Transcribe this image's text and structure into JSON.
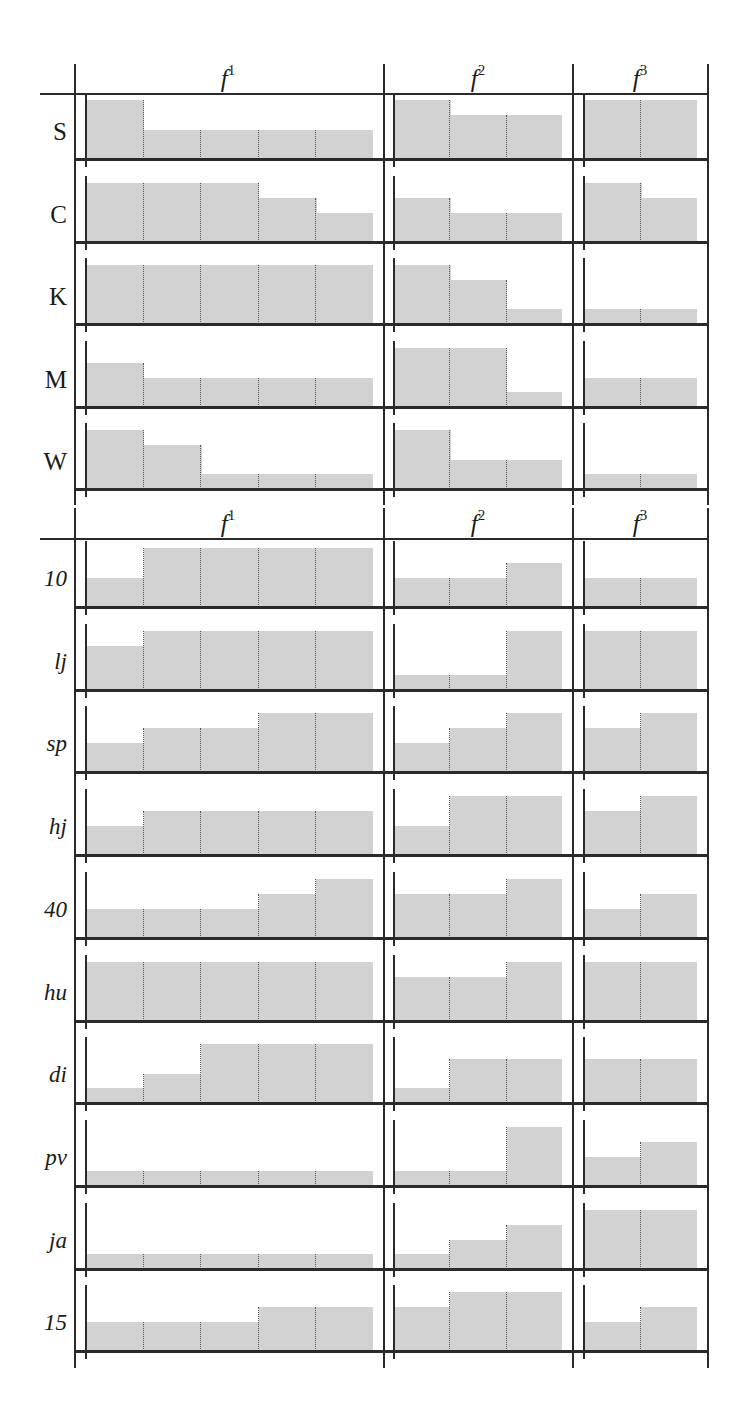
{
  "chart_data": {
    "type": "bar",
    "subtype": "small-multiple step histograms (quantized heights)",
    "title": "",
    "columns": [
      {
        "key": "f1",
        "label": "f",
        "superscript": "1",
        "bins": 5
      },
      {
        "key": "f2",
        "label": "f",
        "superscript": "2",
        "bins": 3
      },
      {
        "key": "f3",
        "label": "f",
        "superscript": "3",
        "bins": 2
      }
    ],
    "value_scale": "relative height, quarters of cell max (0.25, 0.5, 0.75, 1.0)",
    "grid": false,
    "legend": null,
    "sections": [
      {
        "label_style": "upright",
        "rows": [
          {
            "label": "S",
            "f1": [
              1,
              0.5,
              0.5,
              0.5,
              0.5
            ],
            "f2": [
              1,
              0.75,
              0.75
            ],
            "f3": [
              1,
              1
            ]
          },
          {
            "label": "C",
            "f1": [
              1,
              1,
              1,
              0.75,
              0.5
            ],
            "f2": [
              0.75,
              0.5,
              0.5
            ],
            "f3": [
              1,
              0.75
            ]
          },
          {
            "label": "K",
            "f1": [
              1,
              1,
              1,
              1,
              1
            ],
            "f2": [
              1,
              0.75,
              0.25
            ],
            "f3": [
              0.25,
              0.25
            ]
          },
          {
            "label": "M",
            "f1": [
              0.75,
              0.5,
              0.5,
              0.5,
              0.5
            ],
            "f2": [
              1,
              1,
              0.25
            ],
            "f3": [
              0.5,
              0.5
            ]
          },
          {
            "label": "W",
            "f1": [
              1,
              0.75,
              0.25,
              0.25,
              0.25
            ],
            "f2": [
              1,
              0.5,
              0.5
            ],
            "f3": [
              0.25,
              0.25
            ]
          }
        ]
      },
      {
        "label_style": "italic",
        "rows": [
          {
            "label": "10",
            "f1": [
              0.5,
              1,
              1,
              1,
              1
            ],
            "f2": [
              0.5,
              0.5,
              0.75
            ],
            "f3": [
              0.5,
              0.5
            ]
          },
          {
            "label": "lj",
            "f1": [
              0.75,
              1,
              1,
              1,
              1
            ],
            "f2": [
              0.25,
              0.25,
              1
            ],
            "f3": [
              1,
              1
            ]
          },
          {
            "label": "sp",
            "f1": [
              0.5,
              0.75,
              0.75,
              1,
              1
            ],
            "f2": [
              0.5,
              0.75,
              1
            ],
            "f3": [
              0.75,
              1
            ]
          },
          {
            "label": "hj",
            "f1": [
              0.5,
              0.75,
              0.75,
              0.75,
              0.75
            ],
            "f2": [
              0.5,
              1,
              1
            ],
            "f3": [
              0.75,
              1
            ]
          },
          {
            "label": "40",
            "f1": [
              0.5,
              0.5,
              0.5,
              0.75,
              1
            ],
            "f2": [
              0.75,
              0.75,
              1
            ],
            "f3": [
              0.5,
              0.75
            ]
          },
          {
            "label": "hu",
            "f1": [
              1,
              1,
              1,
              1,
              1
            ],
            "f2": [
              0.75,
              0.75,
              1
            ],
            "f3": [
              1,
              1
            ]
          },
          {
            "label": "di",
            "f1": [
              0.25,
              0.5,
              1,
              1,
              1
            ],
            "f2": [
              0.25,
              0.75,
              0.75
            ],
            "f3": [
              0.75,
              0.75
            ]
          },
          {
            "label": "pv",
            "f1": [
              0.25,
              0.25,
              0.25,
              0.25,
              0.25
            ],
            "f2": [
              0.25,
              0.25,
              1
            ],
            "f3": [
              0.5,
              0.75
            ]
          },
          {
            "label": "ja",
            "f1": [
              0.25,
              0.25,
              0.25,
              0.25,
              0.25
            ],
            "f2": [
              0.25,
              0.5,
              0.75
            ],
            "f3": [
              1,
              1
            ]
          },
          {
            "label": "15",
            "f1": [
              0.5,
              0.5,
              0.5,
              0.75,
              0.75
            ],
            "f2": [
              0.75,
              1,
              1
            ],
            "f3": [
              0.5,
              0.75
            ]
          }
        ]
      }
    ],
    "colors": {
      "bar_fill": "#d2d2d2",
      "lines": "#2a2a2a",
      "bin_separators": "#555555"
    }
  }
}
